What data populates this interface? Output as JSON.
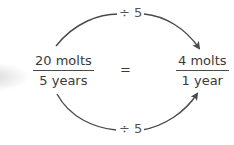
{
  "diagram": {
    "left_fraction": {
      "numerator": "20 molts",
      "denominator": "5 years"
    },
    "equals_sign": "=",
    "right_fraction": {
      "numerator": "4 molts",
      "denominator": "1 year"
    },
    "top_arrow_label": "÷ 5",
    "bottom_arrow_label": "÷ 5",
    "colors": {
      "text": "#3a3a3a",
      "arrow": "#4a4a4a"
    }
  }
}
